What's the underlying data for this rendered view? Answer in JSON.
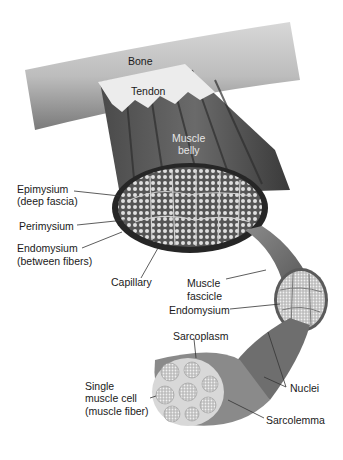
{
  "diagram": {
    "labels": {
      "bone": "Bone",
      "tendon": "Tendon",
      "muscle_belly_1": "Muscle",
      "muscle_belly_2": "belly",
      "epimysium_1": "Epimysium",
      "epimysium_2": "(deep fascia)",
      "perimysium": "Perimysium",
      "endomysium_1": "Endomysium",
      "endomysium_2": "(between fibers)",
      "capillary": "Capillary",
      "muscle_fascicle_1": "Muscle",
      "muscle_fascicle_2": "fascicle",
      "endomysium_fascicle": "Endomysium",
      "sarcoplasm": "Sarcoplasm",
      "single_cell_1": "Single",
      "single_cell_2": "muscle cell",
      "single_cell_3": "(muscle fiber)",
      "nuclei": "Nuclei",
      "sarcolemma": "Sarcolemma"
    },
    "colors": {
      "bone": "#b8b8b8",
      "tendon": "#e8e8e8",
      "muscle": "#5a5a5a",
      "muscle_dark": "#2e2e2e",
      "fiber": "#c9c9c9",
      "leader": "#333333"
    }
  }
}
